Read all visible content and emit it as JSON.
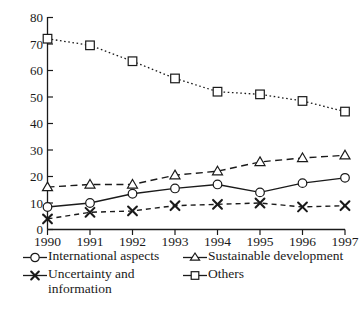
{
  "chart_data": {
    "type": "line",
    "title": "",
    "xlabel": "",
    "ylabel": "",
    "categories": [
      "1990",
      "1991",
      "1992",
      "1993",
      "1994",
      "1995",
      "1996",
      "1997"
    ],
    "x": [
      1990,
      1991,
      1992,
      1993,
      1994,
      1995,
      1996,
      1997
    ],
    "xlim": [
      1990,
      1997
    ],
    "ylim": [
      0,
      80
    ],
    "yticks": [
      0,
      10,
      20,
      30,
      40,
      50,
      60,
      70,
      80
    ],
    "ytick_labels": [
      "0",
      "10",
      "20",
      "30",
      "40",
      "50",
      "60",
      "70",
      "80"
    ],
    "grid": false,
    "legend_position": "below",
    "series": [
      {
        "name": "International aspects",
        "marker": "circle",
        "linestyle": "solid",
        "color": "#1a1a1a",
        "values": [
          8.5,
          10,
          13.5,
          15.5,
          17,
          14,
          17.5,
          19.5
        ]
      },
      {
        "name": "Sustainable development",
        "marker": "triangle",
        "linestyle": "dashed",
        "color": "#1a1a1a",
        "values": [
          16,
          17,
          17,
          20.5,
          22,
          25.5,
          27,
          28
        ]
      },
      {
        "name": "Uncertainty and\ninformation",
        "marker": "x",
        "linestyle": "dashed-short",
        "color": "#1a1a1a",
        "values": [
          4,
          6.5,
          7,
          9,
          9.5,
          10,
          8.5,
          9
        ]
      },
      {
        "name": "Others",
        "marker": "square",
        "linestyle": "dotted",
        "color": "#1a1a1a",
        "values": [
          72,
          69.5,
          63.5,
          57,
          52,
          51,
          48.5,
          44.5
        ]
      }
    ]
  },
  "legend": {
    "items": [
      {
        "label": "International aspects",
        "marker": "circle-marker",
        "name": "legend-international-aspects"
      },
      {
        "label": "Sustainable development",
        "marker": "triangle-marker",
        "name": "legend-sustainable-development"
      },
      {
        "label": "Uncertainty and\ninformation",
        "marker": "x-marker",
        "name": "legend-uncertainty-information"
      },
      {
        "label": "Others",
        "marker": "square-marker",
        "name": "legend-others"
      }
    ]
  },
  "colors": {
    "ink": "#1a1a1a",
    "background": "#ffffff",
    "marker_fill": "#ffffff"
  }
}
